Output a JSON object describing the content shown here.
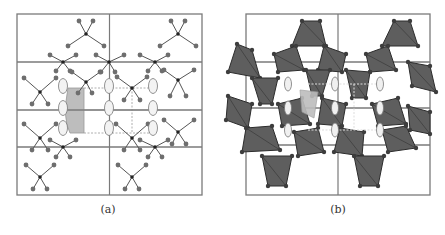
{
  "figure": {
    "panels": [
      {
        "id": "a",
        "caption": "(a)",
        "style": "ball-and-stick"
      },
      {
        "id": "b",
        "caption": "(b)",
        "style": "polyhedral"
      }
    ],
    "colors": {
      "frame": "#7a7a7a",
      "bond": "#555555",
      "atom": "#6e6e6e",
      "center_atom": "#222222",
      "polyhedron": "#5e5e5e",
      "polyhedron_edge": "#2c2c2c",
      "highlight": "#bdbdbd",
      "ellipse_fill": "#f3f3f3",
      "ellipse_stroke": "#777777",
      "dashed": "#9a9a9a"
    }
  }
}
